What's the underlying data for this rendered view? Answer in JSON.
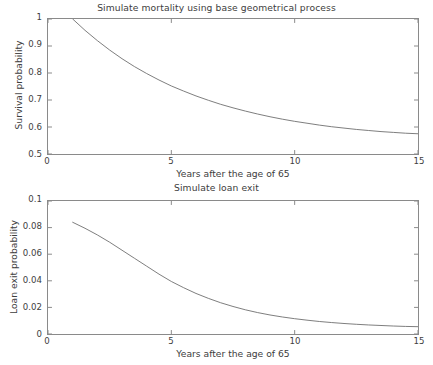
{
  "figure": {
    "background": "#ffffff",
    "line_color": "#6e6e6e",
    "axis_color": "#8a8a8a",
    "text_color": "#3d3d3d"
  },
  "chart_data": [
    {
      "type": "line",
      "id": "mortality",
      "title": "Simulate mortality using base geometrical process",
      "xlabel": "Years after the age of 65",
      "ylabel": "Survival probability",
      "xlim": [
        0,
        15
      ],
      "ylim": [
        0.5,
        1
      ],
      "xticks": [
        0,
        5,
        10,
        15
      ],
      "xticklabels": [
        "0",
        "5",
        "10",
        "15"
      ],
      "yticks": [
        0.5,
        0.6,
        0.7,
        0.8,
        0.9,
        1
      ],
      "yticklabels": [
        "0.5",
        "0.6",
        "0.7",
        "0.8",
        "0.9",
        "1"
      ],
      "grid": false,
      "legend": null,
      "series": [
        {
          "name": "survival probability",
          "x": [
            1,
            1.5,
            2,
            2.5,
            3,
            3.5,
            4,
            4.5,
            5,
            5.5,
            6,
            6.5,
            7,
            7.5,
            8,
            8.5,
            9,
            9.5,
            10,
            10.5,
            11,
            11.5,
            12,
            12.5,
            13,
            13.5,
            14,
            14.5,
            15
          ],
          "y": [
            1.0,
            0.958,
            0.92,
            0.885,
            0.853,
            0.824,
            0.798,
            0.774,
            0.752,
            0.733,
            0.715,
            0.699,
            0.684,
            0.671,
            0.659,
            0.648,
            0.638,
            0.629,
            0.621,
            0.614,
            0.607,
            0.601,
            0.596,
            0.591,
            0.587,
            0.583,
            0.58,
            0.577,
            0.575
          ]
        }
      ]
    },
    {
      "type": "line",
      "id": "loan",
      "title": "Simulate loan exit",
      "xlabel": "Years after the age of 65",
      "ylabel": "Loan exit probability",
      "xlim": [
        0,
        15
      ],
      "ylim": [
        0,
        0.1
      ],
      "xticks": [
        0,
        5,
        10,
        15
      ],
      "xticklabels": [
        "0",
        "5",
        "10",
        "15"
      ],
      "yticks": [
        0,
        0.02,
        0.04,
        0.06,
        0.08,
        0.1
      ],
      "yticklabels": [
        "0",
        "0.02",
        "0.04",
        "0.06",
        "0.08",
        "0.1"
      ],
      "grid": false,
      "legend": null,
      "series": [
        {
          "name": "loan exit probability",
          "x": [
            1,
            1.5,
            2,
            2.5,
            3,
            3.5,
            4,
            4.5,
            5,
            5.5,
            6,
            6.5,
            7,
            7.5,
            8,
            8.5,
            9,
            9.5,
            10,
            10.5,
            11,
            11.5,
            12,
            12.5,
            13,
            13.5,
            14,
            14.5,
            15
          ],
          "y": [
            0.084,
            0.0795,
            0.0745,
            0.069,
            0.063,
            0.057,
            0.051,
            0.045,
            0.0395,
            0.0348,
            0.0305,
            0.0268,
            0.0235,
            0.0207,
            0.0182,
            0.0161,
            0.0143,
            0.0128,
            0.0115,
            0.0104,
            0.0094,
            0.0086,
            0.0079,
            0.0073,
            0.0068,
            0.0064,
            0.006,
            0.0057,
            0.0055
          ]
        }
      ]
    }
  ]
}
